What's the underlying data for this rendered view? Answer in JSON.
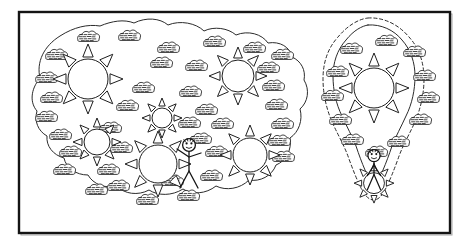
{
  "figure": {
    "background_color": "#ffffff",
    "ink_color": "#1e1e1e",
    "frame": {
      "label": "figure-border",
      "x": 19,
      "y": 12,
      "width": 431,
      "height": 221,
      "stroke": "#141414",
      "stroke_width": 2.4
    },
    "regions": [
      {
        "id": "large-patch",
        "label": "Large habitat patch",
        "outline_style": "solid",
        "has_buffer": false,
        "sun_count": 6,
        "shrub_count": 38,
        "person_count": 1
      },
      {
        "id": "small-patch",
        "label": "Small habitat patch with buffer",
        "outline_style": "solid",
        "has_buffer": true,
        "buffer_style": "dashed",
        "sun_count": 1,
        "shrub_count": 10,
        "person_count": 1
      }
    ],
    "symbols": {
      "sun": {
        "name": "sun-symbol",
        "rays": 8,
        "fill": "#ffffff"
      },
      "shrub": {
        "name": "shrub-symbol",
        "fill": "#ffffff"
      },
      "person": {
        "name": "stick-figure",
        "fill": "#ffffff"
      }
    },
    "large_patch_path": "M 40 78 C 36 62 44 46 60 36 C 74 27 88 24 100 26 C 112 21 124 19 134 23 C 146 17 160 18 168 25 C 180 20 196 23 204 31 C 214 26 228 28 236 35 C 248 30 262 34 268 43 C 280 41 290 47 292 57 C 301 61 306 70 304 80 C 310 90 308 102 300 109 C 303 120 299 132 290 138 C 292 150 286 161 276 165 C 272 176 260 182 249 180 C 240 189 226 191 216 186 C 206 194 192 195 183 189 C 172 196 158 196 149 190 C 138 196 124 194 117 186 C 105 189 93 184 88 175 C 76 175 66 168 64 158 C 53 155 46 146 47 136 C 38 131 34 121 37 111 C 30 103 30 90 40 78 Z",
    "small_patch_path": "M 368 25 C 381 24 394 30 402 40 C 411 50 415 63 415 76 C 415 90 412 104 406 116 C 401 127 396 136 392 146 C 389 155 386 163 383 170 C 381 175 378 178 374 178 C 370 178 367 175 365 170 C 362 163 359 155 356 146 C 352 136 347 127 342 116 C 336 104 333 90 333 76 C 333 63 337 50 346 40 C 354 30 362 26 368 25 Z",
    "small_patch_buffer_path": "M 368 18 C 384 17 399 25 409 37 C 420 49 424 64 424 79 C 424 95 420 111 414 124 C 408 137 402 147 398 159 C 394 170 390 180 386 188 C 382 196 378 200 374 200 C 369 200 365 196 361 188 C 357 180 353 170 349 159 C 345 147 339 137 333 124 C 327 111 323 95 323 79 C 323 64 327 49 338 37 C 348 25 359 19 368 18 Z",
    "suns": [
      {
        "cx": 88,
        "cy": 79,
        "r": 20,
        "ray": 13
      },
      {
        "cx": 162,
        "cy": 118,
        "r": 10,
        "ray": 8
      },
      {
        "cx": 97,
        "cy": 142,
        "r": 13,
        "ray": 9
      },
      {
        "cx": 158,
        "cy": 164,
        "r": 19,
        "ray": 12
      },
      {
        "cx": 238,
        "cy": 76,
        "r": 16,
        "ray": 11
      },
      {
        "cx": 250,
        "cy": 155,
        "r": 17,
        "ray": 11
      },
      {
        "cx": 374,
        "cy": 88,
        "r": 20,
        "ray": 13
      }
    ],
    "shrubs": [
      {
        "x": 88,
        "y": 37
      },
      {
        "x": 129,
        "y": 36
      },
      {
        "x": 56,
        "y": 55
      },
      {
        "x": 168,
        "y": 48
      },
      {
        "x": 214,
        "y": 42
      },
      {
        "x": 254,
        "y": 48
      },
      {
        "x": 46,
        "y": 78
      },
      {
        "x": 161,
        "y": 63
      },
      {
        "x": 196,
        "y": 66
      },
      {
        "x": 268,
        "y": 68
      },
      {
        "x": 282,
        "y": 55
      },
      {
        "x": 51,
        "y": 98
      },
      {
        "x": 143,
        "y": 88
      },
      {
        "x": 190,
        "y": 92
      },
      {
        "x": 273,
        "y": 86
      },
      {
        "x": 46,
        "y": 117
      },
      {
        "x": 127,
        "y": 106
      },
      {
        "x": 206,
        "y": 110
      },
      {
        "x": 276,
        "y": 105
      },
      {
        "x": 60,
        "y": 135
      },
      {
        "x": 110,
        "y": 128
      },
      {
        "x": 189,
        "y": 123
      },
      {
        "x": 222,
        "y": 124
      },
      {
        "x": 282,
        "y": 124
      },
      {
        "x": 70,
        "y": 152
      },
      {
        "x": 121,
        "y": 148
      },
      {
        "x": 200,
        "y": 139
      },
      {
        "x": 279,
        "y": 141
      },
      {
        "x": 64,
        "y": 170
      },
      {
        "x": 108,
        "y": 170
      },
      {
        "x": 216,
        "y": 152
      },
      {
        "x": 283,
        "y": 157
      },
      {
        "x": 118,
        "y": 186
      },
      {
        "x": 172,
        "y": 181
      },
      {
        "x": 211,
        "y": 176
      },
      {
        "x": 147,
        "y": 200
      },
      {
        "x": 188,
        "y": 196
      },
      {
        "x": 96,
        "y": 190
      },
      {
        "x": 351,
        "y": 49
      },
      {
        "x": 386,
        "y": 41
      },
      {
        "x": 414,
        "y": 52
      },
      {
        "x": 337,
        "y": 72
      },
      {
        "x": 424,
        "y": 76
      },
      {
        "x": 332,
        "y": 96
      },
      {
        "x": 428,
        "y": 98
      },
      {
        "x": 340,
        "y": 120
      },
      {
        "x": 420,
        "y": 120
      },
      {
        "x": 352,
        "y": 140
      },
      {
        "x": 398,
        "y": 142
      },
      {
        "x": 376,
        "y": 152
      }
    ],
    "people": [
      {
        "id": "person-left",
        "x": 189,
        "y": 157,
        "scale": 1.0,
        "sun_body": false
      },
      {
        "id": "person-right",
        "x": 374,
        "y": 167,
        "scale": 0.95,
        "sun_body": true
      }
    ]
  }
}
